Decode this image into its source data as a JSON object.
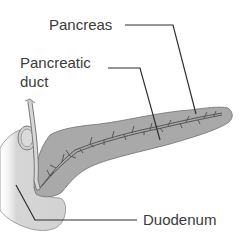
{
  "figure": {
    "type": "anatomical-diagram",
    "labels": {
      "pancreas": "Pancreas",
      "pancreatic_duct_line1": "Pancreatic",
      "pancreatic_duct_line2": "duct",
      "duodenum": "Duodenum"
    },
    "colors": {
      "pancreas_fill": "#a9a9a9",
      "pancreas_outline": "#6e6e6e",
      "duodenum_fill": "#d4d4d4",
      "duodenum_outline": "#8a8a8a",
      "duct": "#5a5a5a",
      "leader_line": "#2f2f2f",
      "text": "#3a3a3a",
      "background": "#ffffff"
    }
  }
}
